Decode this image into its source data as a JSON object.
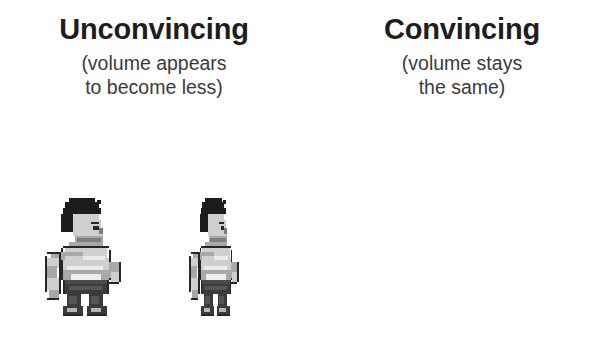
{
  "background_color": "#ffffff",
  "heading_color": "#1d1d1d",
  "subtitle_color": "#3a3a3a",
  "columns": [
    {
      "key": "unconvincing",
      "heading": "Unconvincing",
      "subtitle_line1": "(volume appears",
      "subtitle_line2": "to become less)",
      "figures": [
        {
          "name": "wrestler-original",
          "variant": "original",
          "width_px": 80,
          "height_px": 122
        },
        {
          "name": "wrestler-squashed",
          "variant": "narrow-same-height",
          "width_px": 52,
          "height_px": 122
        }
      ]
    },
    {
      "key": "convincing",
      "heading": "Convincing",
      "subtitle_line1": "(volume stays",
      "subtitle_line2": "the same)",
      "figures": [
        {
          "name": "wrestler-original",
          "variant": "original",
          "width_px": 80,
          "height_px": 122
        },
        {
          "name": "wrestler-stretched",
          "variant": "narrow-taller",
          "width_px": 50,
          "height_px": 170
        }
      ]
    }
  ],
  "sprite_palette": {
    "outline": "#262626",
    "hair": "#1c1c1c",
    "skin_dark": "#7d7d7d",
    "skin_mid": "#a8a8a8",
    "skin_light": "#cfcfcf",
    "highlight": "#ececec",
    "trunks": "#3b3b3b",
    "boots": "#4a4a4a"
  }
}
